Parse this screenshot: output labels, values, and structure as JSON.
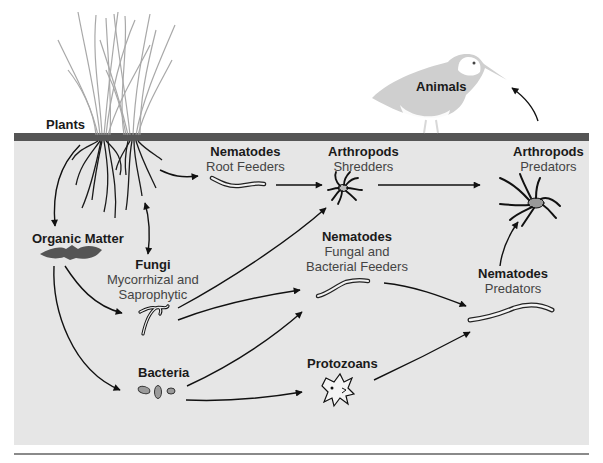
{
  "diagram": {
    "type": "soil-food-web",
    "colors": {
      "soil_background": "#e6e6e6",
      "surface_band": "#555555",
      "baseline": "#8a8a8a",
      "arrow": "#111111",
      "bird": "#c8c8c8",
      "organic_matter": "#555555",
      "spider_body": "#999999"
    },
    "nodes": {
      "plants": {
        "title": "Plants"
      },
      "animals": {
        "title": "Animals"
      },
      "nematodes_root": {
        "title": "Nematodes",
        "subtitle": "Root Feeders"
      },
      "arthropods_shredders": {
        "title": "Arthropods",
        "subtitle": "Shredders"
      },
      "arthropods_predators": {
        "title": "Arthropods",
        "subtitle": "Predators"
      },
      "organic_matter": {
        "title": "Organic Matter"
      },
      "fungi": {
        "title": "Fungi",
        "subtitle_line1": "Mycorrhizal and",
        "subtitle_line2": "Saprophytic"
      },
      "nematodes_fungal": {
        "title": "Nematodes",
        "subtitle_line1": "Fungal and",
        "subtitle_line2": "Bacterial Feeders"
      },
      "nematodes_predators": {
        "title": "Nematodes",
        "subtitle": "Predators"
      },
      "bacteria": {
        "title": "Bacteria"
      },
      "protozoans": {
        "title": "Protozoans"
      }
    },
    "edges": [
      {
        "from": "Plants",
        "to": "Organic Matter"
      },
      {
        "from": "Plants",
        "to": "Nematodes Root Feeders"
      },
      {
        "from": "Plants",
        "to": "Fungi",
        "bidirectional": true
      },
      {
        "from": "Nematodes Root Feeders",
        "to": "Arthropods Shredders"
      },
      {
        "from": "Arthropods Shredders",
        "to": "Arthropods Predators"
      },
      {
        "from": "Organic Matter",
        "to": "Fungi"
      },
      {
        "from": "Organic Matter",
        "to": "Bacteria"
      },
      {
        "from": "Fungi",
        "to": "Arthropods Shredders"
      },
      {
        "from": "Fungi",
        "to": "Nematodes Fungal and Bacterial Feeders"
      },
      {
        "from": "Bacteria",
        "to": "Nematodes Fungal and Bacterial Feeders"
      },
      {
        "from": "Bacteria",
        "to": "Protozoans"
      },
      {
        "from": "Nematodes Fungal and Bacterial Feeders",
        "to": "Nematodes Predators"
      },
      {
        "from": "Protozoans",
        "to": "Nematodes Predators"
      },
      {
        "from": "Nematodes Predators",
        "to": "Arthropods Predators"
      },
      {
        "from": "Arthropods Predators",
        "to": "Animals"
      }
    ]
  }
}
